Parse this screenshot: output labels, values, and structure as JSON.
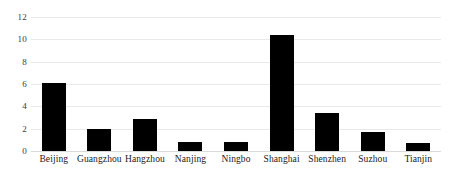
{
  "chart_data": {
    "type": "bar",
    "title": "",
    "subtitle": "",
    "xlabel": "",
    "ylabel": "",
    "categories": [
      "Beijing",
      "Guangzhou",
      "Hangzhou",
      "Nanjing",
      "Ningbo",
      "Shanghai",
      "Shenzhen",
      "Suzhou",
      "Tianjin"
    ],
    "values": [
      6.1,
      2.0,
      2.9,
      0.85,
      0.85,
      10.4,
      3.4,
      1.7,
      0.7
    ],
    "series": [
      {
        "name": "",
        "values": [
          6.1,
          2.0,
          2.9,
          0.85,
          0.85,
          10.4,
          3.4,
          1.7,
          0.7
        ]
      }
    ],
    "ylim": [
      0,
      12
    ],
    "yticks": [
      0,
      2,
      4,
      6,
      8,
      10,
      12
    ],
    "ytick_labels": [
      "0",
      "2",
      "4",
      "6",
      "8",
      "10",
      "12"
    ],
    "grid": true,
    "grid_axis": "y",
    "legend": false,
    "legend_position": "none",
    "bar_color": "#000000",
    "grid_color": "#e9e9e9",
    "background_color": "#ffffff",
    "annotations": []
  }
}
